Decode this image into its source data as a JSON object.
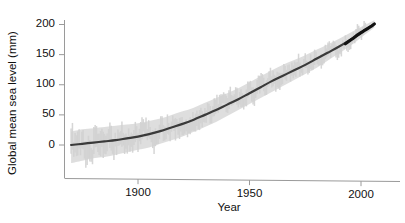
{
  "chart_data": {
    "type": "line",
    "title": "",
    "xlabel": "Year",
    "ylabel": "Global mean sea level (mm)",
    "xlim": [
      1866,
      2008
    ],
    "ylim": [
      -60,
      215
    ],
    "xticks": [
      1900,
      1950,
      2000
    ],
    "xticklabels": [
      "1900",
      "1950",
      "2000"
    ],
    "yticks": [
      0,
      50,
      100,
      150,
      200
    ],
    "yticklabels": [
      "0",
      "50",
      "100",
      "150",
      "200"
    ],
    "grid": false,
    "legend": null,
    "series": [
      {
        "name": "Global mean sea level (smoothed trend)",
        "style": "line",
        "color": "#3a3a3a",
        "x": [
          1870,
          1875,
          1880,
          1885,
          1890,
          1895,
          1900,
          1905,
          1910,
          1915,
          1920,
          1925,
          1930,
          1935,
          1940,
          1945,
          1950,
          1955,
          1960,
          1965,
          1970,
          1975,
          1980,
          1985,
          1990,
          1995,
          2000,
          2003,
          2006
        ],
        "values": [
          0,
          2,
          4,
          6,
          8,
          11,
          14,
          18,
          23,
          29,
          35,
          42,
          50,
          58,
          67,
          76,
          86,
          96,
          106,
          115,
          124,
          133,
          143,
          153,
          163,
          174,
          186,
          194,
          201
        ]
      },
      {
        "name": "Satellite altimetry segment",
        "style": "line-bold",
        "color": "#111111",
        "x": [
          1993,
          1996,
          1999,
          2002,
          2005,
          2006
        ],
        "values": [
          168,
          176,
          184,
          191,
          198,
          201
        ]
      },
      {
        "name": "Uncertainty band (tide gauge reconstruction)",
        "style": "band",
        "color": "#dcdcdc",
        "x": [
          1870,
          1875,
          1880,
          1885,
          1890,
          1895,
          1900,
          1905,
          1910,
          1915,
          1920,
          1925,
          1930,
          1935,
          1940,
          1945,
          1950,
          1955,
          1960,
          1965,
          1970,
          1975,
          1980,
          1985,
          1990,
          1995,
          2000,
          2006
        ],
        "lower": [
          -30,
          -26,
          -22,
          -20,
          -16,
          -12,
          -8,
          -4,
          2,
          8,
          14,
          22,
          30,
          38,
          48,
          58,
          68,
          78,
          88,
          98,
          108,
          118,
          128,
          140,
          152,
          164,
          178,
          195
        ],
        "upper": [
          22,
          26,
          28,
          30,
          32,
          34,
          36,
          40,
          44,
          50,
          56,
          62,
          70,
          78,
          86,
          94,
          104,
          114,
          124,
          133,
          141,
          149,
          158,
          167,
          176,
          186,
          196,
          207
        ]
      }
    ],
    "noise_series": {
      "name": "Annual reconstruction (noisy)",
      "color": "#d2d2d2",
      "amplitude_mm": 18,
      "description": "Jagged year-to-year variability shading around the smooth trend"
    },
    "axis_color": "#9a9a9a",
    "tick_color": "#9a9a9a",
    "background": "#ffffff"
  }
}
